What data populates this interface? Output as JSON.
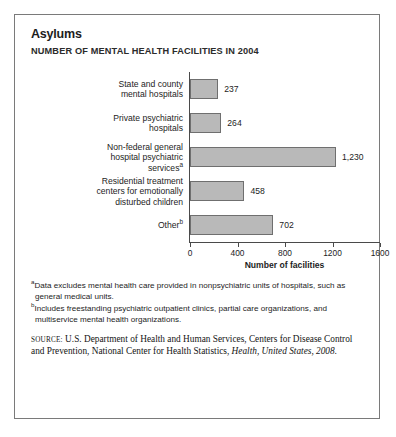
{
  "header": {
    "title": "Asylums",
    "subtitle": "NUMBER OF MENTAL HEALTH FACILITIES IN 2004"
  },
  "chart_data": {
    "type": "bar",
    "orientation": "horizontal",
    "title": "Asylums",
    "subtitle": "NUMBER OF MENTAL HEALTH FACILITIES IN 2004",
    "xlabel": "Number of facilities",
    "ylabel": "",
    "xlim": [
      0,
      1600
    ],
    "xticks": [
      0,
      400,
      800,
      1200,
      1600
    ],
    "xtick_labels": [
      "0",
      "400",
      "800",
      "1200",
      "1600"
    ],
    "grid": false,
    "legend": null,
    "bar_color": "#b9b9b9",
    "bar_edge_color": "#6f6f6f",
    "categories": [
      "State and county mental hospitals",
      "Private psychiatric hospitals",
      "Non-federal general hospital psychiatric services",
      "Residential treatment centers for emotionally disturbed children",
      "Other"
    ],
    "category_lines": [
      [
        "State and county",
        "mental hospitals"
      ],
      [
        "Private psychiatric",
        "hospitals"
      ],
      [
        "Non-federal general",
        "hospital psychiatric",
        "services"
      ],
      [
        "Residential treatment",
        "centers for emotionally",
        "disturbed children"
      ],
      [
        "Other"
      ]
    ],
    "category_footnote_markers": [
      "",
      "",
      "a",
      "",
      "b"
    ],
    "values": [
      237,
      264,
      1230,
      458,
      702
    ],
    "value_labels": [
      "237",
      "264",
      "1,230",
      "458",
      "702"
    ]
  },
  "notes": [
    {
      "marker": "a",
      "text": "Data excludes mental health care provided in nonpsychiatric units of hospitals, such as general medical units."
    },
    {
      "marker": "b",
      "text": "Includes freestanding psychiatric outpatient clinics, partial care organizations, and multiservice mental health organizations."
    }
  ],
  "source": {
    "lead": "source:",
    "text_before_italic": " U.S. Department of Health and Human Services, Centers for Disease Control and Prevention, National Center for Health Statistics, ",
    "italic": "Health, United States, 2008."
  }
}
